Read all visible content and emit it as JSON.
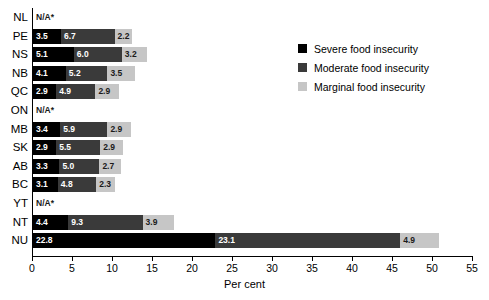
{
  "chart_data": {
    "type": "bar",
    "orientation": "horizontal",
    "stacked": true,
    "title": "",
    "xlabel": "Per cent",
    "ylabel": "",
    "xlim": [
      0,
      55
    ],
    "xticks": [
      0,
      5,
      10,
      15,
      20,
      25,
      30,
      35,
      40,
      45,
      50,
      55
    ],
    "grid": false,
    "legend_position": "top-right",
    "na_marker": "N/A*",
    "categories": [
      "NL",
      "PE",
      "NS",
      "NB",
      "QC",
      "ON",
      "MB",
      "SK",
      "AB",
      "BC",
      "YT",
      "NT",
      "NU"
    ],
    "series": [
      {
        "name": "Severe food insecurity",
        "color": "#000000",
        "values": [
          null,
          3.5,
          5.1,
          4.1,
          2.9,
          null,
          3.4,
          2.9,
          3.3,
          3.1,
          null,
          4.4,
          22.8
        ]
      },
      {
        "name": "Moderate food insecurity",
        "color": "#3a3a3a",
        "values": [
          null,
          6.7,
          6.0,
          5.2,
          4.9,
          null,
          5.9,
          5.5,
          5.0,
          4.8,
          null,
          9.3,
          23.1
        ]
      },
      {
        "name": "Marginal food insecurity",
        "color": "#c6c6c6",
        "values": [
          null,
          2.2,
          3.2,
          3.5,
          2.9,
          null,
          2.9,
          2.9,
          2.7,
          2.3,
          null,
          3.9,
          4.9
        ]
      }
    ],
    "rows": [
      {
        "label": "NL",
        "na": true,
        "segments": []
      },
      {
        "label": "PE",
        "na": false,
        "segments": [
          {
            "class": "severe",
            "value": 3.5
          },
          {
            "class": "moderate",
            "value": 6.7
          },
          {
            "class": "marginal",
            "value": 2.2
          }
        ]
      },
      {
        "label": "NS",
        "na": false,
        "segments": [
          {
            "class": "severe",
            "value": 5.1
          },
          {
            "class": "moderate",
            "value": 6.0
          },
          {
            "class": "marginal",
            "value": 3.2
          }
        ]
      },
      {
        "label": "NB",
        "na": false,
        "segments": [
          {
            "class": "severe",
            "value": 4.1
          },
          {
            "class": "moderate",
            "value": 5.2
          },
          {
            "class": "marginal",
            "value": 3.5
          }
        ]
      },
      {
        "label": "QC",
        "na": false,
        "segments": [
          {
            "class": "severe",
            "value": 2.9
          },
          {
            "class": "moderate",
            "value": 4.9
          },
          {
            "class": "marginal",
            "value": 2.9
          }
        ]
      },
      {
        "label": "ON",
        "na": true,
        "segments": []
      },
      {
        "label": "MB",
        "na": false,
        "segments": [
          {
            "class": "severe",
            "value": 3.4
          },
          {
            "class": "moderate",
            "value": 5.9
          },
          {
            "class": "marginal",
            "value": 2.9
          }
        ]
      },
      {
        "label": "SK",
        "na": false,
        "segments": [
          {
            "class": "severe",
            "value": 2.9
          },
          {
            "class": "moderate",
            "value": 5.5
          },
          {
            "class": "marginal",
            "value": 2.9
          }
        ]
      },
      {
        "label": "AB",
        "na": false,
        "segments": [
          {
            "class": "severe",
            "value": 3.3
          },
          {
            "class": "moderate",
            "value": 5.0
          },
          {
            "class": "marginal",
            "value": 2.7
          }
        ]
      },
      {
        "label": "BC",
        "na": false,
        "segments": [
          {
            "class": "severe",
            "value": 3.1
          },
          {
            "class": "moderate",
            "value": 4.8
          },
          {
            "class": "marginal",
            "value": 2.3
          }
        ]
      },
      {
        "label": "YT",
        "na": true,
        "segments": []
      },
      {
        "label": "NT",
        "na": false,
        "segments": [
          {
            "class": "severe",
            "value": 4.4
          },
          {
            "class": "moderate",
            "value": 9.3
          },
          {
            "class": "marginal",
            "value": 3.9
          }
        ]
      },
      {
        "label": "NU",
        "na": false,
        "segments": [
          {
            "class": "severe",
            "value": 22.8
          },
          {
            "class": "moderate",
            "value": 23.1
          },
          {
            "class": "marginal",
            "value": 4.9
          }
        ]
      }
    ],
    "legend": [
      {
        "key": "severe",
        "label": "Severe food insecurity",
        "color": "#000000"
      },
      {
        "key": "moderate",
        "label": "Moderate food insecurity",
        "color": "#3a3a3a"
      },
      {
        "key": "marginal",
        "label": "Marginal food insecurity",
        "color": "#c6c6c6"
      }
    ]
  }
}
